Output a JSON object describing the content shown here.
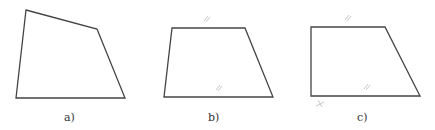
{
  "figures": [
    {
      "id": "a",
      "label": "a)",
      "description": "Irregular quadrilateral",
      "vertices": [
        [
          26,
          10
        ],
        [
          97,
          29
        ],
        [
          125,
          98
        ],
        [
          16,
          98
        ]
      ],
      "label_pos": [
        70,
        118
      ],
      "marks": []
    },
    {
      "id": "b",
      "label": "b)",
      "description": "Trapezoid with parallel top and bottom sides marked",
      "vertices": [
        [
          172,
          28
        ],
        [
          245,
          28
        ],
        [
          273,
          97
        ],
        [
          164,
          97
        ]
      ],
      "label_pos": [
        213,
        118
      ],
      "marks": [
        "parallel-top",
        "parallel-bottom"
      ]
    },
    {
      "id": "c",
      "label": "c)",
      "description": "Right trapezoid with parallel marks and right angle mark",
      "vertices": [
        [
          311,
          27
        ],
        [
          385,
          27
        ],
        [
          420,
          96
        ],
        [
          311,
          96
        ]
      ],
      "label_pos": [
        360,
        118
      ],
      "marks": [
        "parallel-top",
        "parallel-bottom",
        "right-angle-bottom-left"
      ]
    }
  ],
  "colors": {
    "stroke": "#444444",
    "mark": "#c8c8c8",
    "label": "#333333"
  }
}
